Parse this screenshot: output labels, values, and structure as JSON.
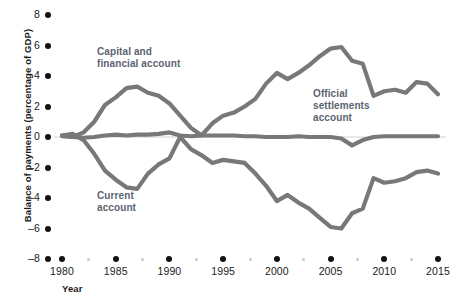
{
  "chart_data": {
    "type": "line",
    "title": "",
    "xlabel": "Year",
    "ylabel": "Balance of payments (percentage of GDP)",
    "xlim": [
      1980,
      2015
    ],
    "ylim": [
      -8,
      8
    ],
    "grid": false,
    "legend_position": "inline-annotations",
    "x_ticks_major": [
      1980,
      1985,
      1990,
      1995,
      2000,
      2005,
      2010,
      2015
    ],
    "x_ticks_minor": [
      1982.5,
      1987.5,
      1992.5,
      1997.5,
      2002.5,
      2007.5,
      2012.5
    ],
    "y_ticks": [
      8,
      6,
      4,
      2,
      0,
      -2,
      -4,
      -6,
      -8
    ],
    "y_tick_labels": [
      "8",
      "6",
      "4",
      "2",
      "0",
      "–2",
      "–4",
      "–6",
      "–8"
    ],
    "x": [
      1980,
      1981,
      1982,
      1983,
      1984,
      1985,
      1986,
      1987,
      1988,
      1989,
      1990,
      1991,
      1992,
      1993,
      1994,
      1995,
      1996,
      1997,
      1998,
      1999,
      2000,
      2001,
      2002,
      2003,
      2004,
      2005,
      2006,
      2007,
      2008,
      2009,
      2010,
      2011,
      2012,
      2013,
      2014,
      2015
    ],
    "series": [
      {
        "name": "Capital and financial account",
        "color": "#787878",
        "values": [
          0.1,
          0.0,
          0.3,
          1.0,
          2.1,
          2.6,
          3.2,
          3.3,
          2.9,
          2.7,
          2.2,
          1.4,
          0.6,
          0.1,
          0.9,
          1.4,
          1.6,
          2.0,
          2.5,
          3.5,
          4.2,
          3.8,
          4.2,
          4.7,
          5.3,
          5.8,
          5.9,
          5.0,
          4.8,
          2.7,
          3.0,
          3.1,
          2.9,
          3.6,
          3.5,
          2.8
        ]
      },
      {
        "name": "Current account",
        "color": "#787878",
        "values": [
          0.1,
          0.2,
          -0.2,
          -1.1,
          -2.2,
          -2.8,
          -3.3,
          -3.4,
          -2.4,
          -1.8,
          -1.4,
          0.0,
          -0.8,
          -1.2,
          -1.7,
          -1.5,
          -1.6,
          -1.7,
          -2.4,
          -3.2,
          -4.2,
          -3.8,
          -4.3,
          -4.7,
          -5.3,
          -5.9,
          -6.0,
          -5.0,
          -4.7,
          -2.7,
          -3.0,
          -2.9,
          -2.7,
          -2.3,
          -2.2,
          -2.4
        ]
      },
      {
        "name": "Official settlements account",
        "color": "#787878",
        "values": [
          0.05,
          0.0,
          -0.05,
          0.0,
          0.1,
          0.15,
          0.1,
          0.15,
          0.15,
          0.2,
          0.3,
          0.1,
          0.05,
          0.1,
          0.1,
          0.1,
          0.1,
          0.05,
          0.05,
          0.0,
          0.0,
          0.0,
          0.05,
          0.0,
          0.0,
          0.0,
          -0.1,
          -0.55,
          -0.2,
          0.0,
          0.05,
          0.05,
          0.05,
          0.05,
          0.05,
          0.05
        ]
      }
    ],
    "annotations": [
      {
        "text_lines": [
          "Capital and",
          "financial account"
        ],
        "x_px": 97,
        "y_px": 46
      },
      {
        "text_lines": [
          "Current",
          "account"
        ],
        "x_px": 97,
        "y_px": 190
      },
      {
        "text_lines": [
          "Official",
          "settlements",
          "account"
        ],
        "x_px": 313,
        "y_px": 88
      }
    ]
  },
  "axis": {
    "y_title": "Balance of payments (percentage of GDP)",
    "x_title": "Year"
  },
  "colors": {
    "line": "#787878",
    "zero_line": "#d0d0d0",
    "tick_dot": "#111111",
    "minor_tick_dot": "#c9c9c9",
    "annotation_text": "#5b6470",
    "axis_text": "#1b1b1b",
    "background": "#ffffff"
  }
}
